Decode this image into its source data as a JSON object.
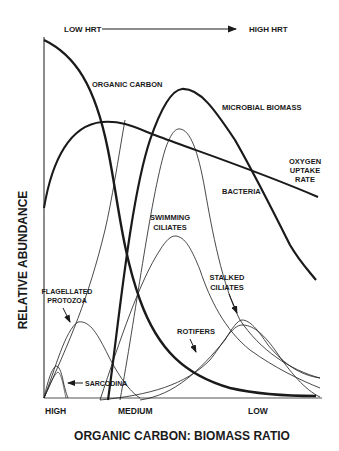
{
  "diagram": {
    "top_arrow": {
      "left_label": "LOW HRT",
      "right_label": "HIGH HRT"
    },
    "y_axis_label": "RELATIVE ABUNDANCE",
    "x_axis_label": "ORGANIC CARBON:  BIOMASS RATIO",
    "x_ticks": [
      "HIGH",
      "MEDIUM",
      "LOW"
    ],
    "curves": {
      "organic_carbon": "ORGANIC CARBON",
      "microbial_biomass": "MICROBIAL BIOMASS",
      "oxygen_uptake_line1": "OXYGEN",
      "oxygen_uptake_line2": "UPTAKE",
      "oxygen_uptake_line3": "RATE",
      "bacteria": "BACTERIA",
      "swimming_ciliates_line1": "SWIMMING",
      "swimming_ciliates_line2": "CILIATES",
      "stalked_ciliates_line1": "STALKED",
      "stalked_ciliates_line2": "CILIATES",
      "flagellated_protozoa_line1": "FLAGELLATED",
      "flagellated_protozoa_line2": "PROTOZOA",
      "rotifers": "ROTIFERS",
      "sarcodina": "SARCODINA"
    },
    "colors": {
      "ink": "#1a1a1a",
      "background": "#ffffff"
    }
  }
}
